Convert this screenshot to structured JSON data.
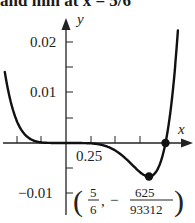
{
  "caption": "and min at x = 5/6",
  "chart_data": {
    "type": "line",
    "title": "",
    "function": "y = x^5 (x - 1) / 10",
    "xlabel": "x",
    "ylabel": "y",
    "xlim": [
      -0.66,
      1.3
    ],
    "ylim": [
      -0.0115,
      0.025
    ],
    "x_ticks": [
      -0.5,
      -0.25,
      0,
      0.25,
      0.5,
      0.75,
      1.0
    ],
    "x_tick_labels": {
      "0.25": "0.25"
    },
    "y_ticks": [
      -0.01,
      -0.005,
      0,
      0.005,
      0.01,
      0.015,
      0.02
    ],
    "y_tick_labels": {
      "-0.01": "−0.01",
      "0.01": "0.01",
      "0.02": "0.02"
    },
    "grid": false,
    "series": [
      {
        "name": "f(x)",
        "x": [
          -0.61,
          -0.5,
          -0.4,
          -0.3,
          -0.2,
          -0.1,
          0,
          0.2,
          0.4,
          0.6,
          0.7,
          0.8,
          0.8333,
          0.9,
          0.95,
          1.0,
          1.05,
          1.1,
          1.13
        ],
        "values": [
          0.0135,
          0.0047,
          0.00143,
          0.00032,
          3.8e-05,
          1.1e-06,
          0,
          -2.56e-05,
          -0.000614,
          -0.00311,
          -0.00504,
          -0.00655,
          -0.0067,
          -0.0059,
          -0.00387,
          0,
          0.00638,
          0.0161,
          0.0239
        ]
      }
    ],
    "annotations": [
      {
        "type": "point",
        "x": 0.8333,
        "y": -0.0067,
        "label_num_x": "5",
        "label_den_x": "6",
        "label_num_y": "625",
        "label_den_y": "93312",
        "label": "(5/6, −625/93312)"
      },
      {
        "type": "point",
        "x": 1.0,
        "y": 0
      }
    ]
  },
  "labels": {
    "y_axis": "y",
    "x_axis": "x",
    "y_002": "0.02",
    "y_001": "0.01",
    "y_m001": "−0.01",
    "x_025": "0.25",
    "point_open": "(",
    "point_close": ")",
    "frac_x_num": "5",
    "frac_x_den": "6",
    "comma": ",",
    "minus": "−",
    "frac_y_num": "625",
    "frac_y_den": "93312"
  }
}
